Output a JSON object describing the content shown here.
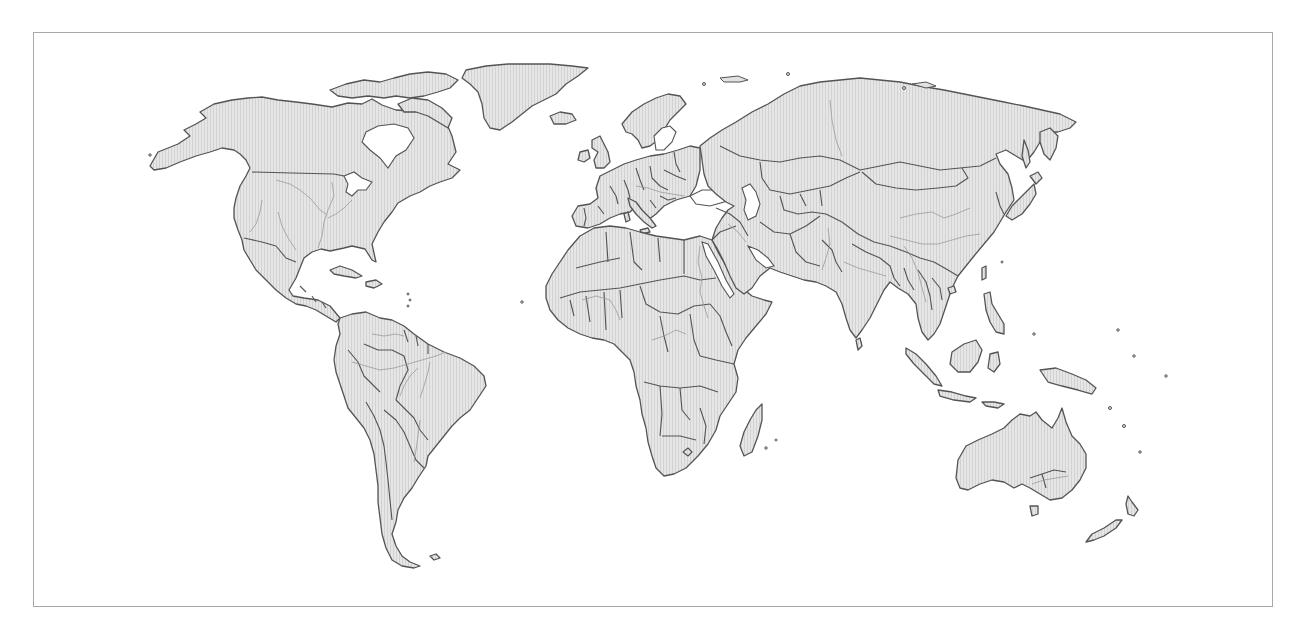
{
  "map": {
    "type": "world-political-outline",
    "projection": "equirectangular",
    "frame": {
      "x": 33,
      "y": 32,
      "width": 1240,
      "height": 575,
      "stroke": "#a8a8a8"
    },
    "style": {
      "background": "#ffffff",
      "land_fill": "#e6e6e6",
      "land_hatch": "#d2d2d2",
      "border_color": "#545454",
      "river_color": "#9a9a9a"
    },
    "layers": [
      "land",
      "country-borders",
      "rivers",
      "lakes"
    ],
    "continents": [
      {
        "name": "North America"
      },
      {
        "name": "South America"
      },
      {
        "name": "Europe"
      },
      {
        "name": "Africa"
      },
      {
        "name": "Asia"
      },
      {
        "name": "Oceania"
      }
    ],
    "labels": []
  }
}
